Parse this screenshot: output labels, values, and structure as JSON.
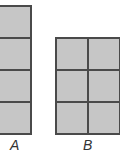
{
  "shapes": [
    {
      "label": "A",
      "rows": 4,
      "cols": 1
    },
    {
      "label": "B",
      "rows": 3,
      "cols": 2
    }
  ],
  "colors": {
    "fill": "#c6c6c6",
    "border": "#4a4a4a"
  }
}
